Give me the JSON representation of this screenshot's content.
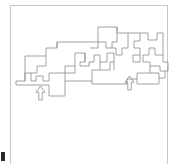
{
  "figure": {
    "kind": "line-drawing",
    "canvas": {
      "width": 175,
      "height": 164
    },
    "background_color": "#ffffff",
    "line_color": "#8a8a8a",
    "frame_color": "#c8c8c8",
    "mark_color": "#2b2b2b"
  },
  "frame": {
    "name": "border-frame",
    "x": 10.5,
    "y": 5.5,
    "width": 157,
    "height": 165,
    "stroke": "#c8c8c8",
    "stroke_width": 1
  },
  "outline": {
    "name": "rectilinear-outline",
    "stroke": "#8a8a8a",
    "stroke_width": 0.8,
    "segments": [
      "M16,85 L16,81 L25,81 L25,73 L31,73 L31,81 L36,81 L36,76 L43,76 L43,81 L49,81 L49,73 L65,73 L65,96 L49,96 L49,85 L16,85 Z",
      "M25,81 L25,56 L46,56 L46,66 L37,66 L37,73 L31,73",
      "M46,56 L46,48 L57,48 L57,42 L98,42 L98,48 L90,48",
      "M65,73 L65,66 L75,66 L75,53 L85,53 L85,62 L80,62 L80,66 L89,66 L89,62 L94,62 L94,55 L100,55 L100,62 L107,62 L107,53 L114,53 L114,62 L110,62 L110,70 L92,70 L92,81 L65,81",
      "M92,81 L92,84 L127,84 L127,79 L137,79 L137,84 L159,84 L159,73 L150,73 L150,66 L160,66 L160,71 L165,71 L165,78 L159,78",
      "M98,42 L98,27 L117,27 L117,42 L112,42 L112,48 L106,48 L106,42 L98,42",
      "M117,27 L117,33 L128,33 L128,48 L122,48 L122,55 L116,55 L116,48 L112,48",
      "M128,33 L140,33 L140,41 L134,41 L134,48 L140,48 L140,55 L133,55 L133,62 L140,62 L140,55",
      "M140,33 L148,33 L148,40 L157,40 L157,33 L163,33 L163,55 L155,55 L155,48 L149,48 L149,55 L143,55 L143,62 L150,62 L150,66",
      "M163,55 L163,62 L168,62 L168,71 L165,71",
      "M57,48 L57,42",
      "M75,66 L75,73 L65,73",
      "M85,62 L85,53",
      "M100,62 L100,70",
      "M114,62 L114,70",
      "M137,79 L137,73 L150,73"
    ]
  },
  "annotations": [
    {
      "name": "arrow-up-left",
      "label": "up-arrow-marker",
      "kind": "arrow-up-icon",
      "x": 36,
      "y": 86,
      "width": 9,
      "height": 14
    },
    {
      "name": "arrow-up-right",
      "label": "up-arrow-marker",
      "kind": "arrow-up-icon",
      "x": 125,
      "y": 76,
      "width": 9,
      "height": 14
    }
  ],
  "corner_mark": {
    "name": "bottom-left-mark",
    "x": 1,
    "y": 152,
    "width": 4,
    "height": 9,
    "color": "#2b2b2b"
  }
}
